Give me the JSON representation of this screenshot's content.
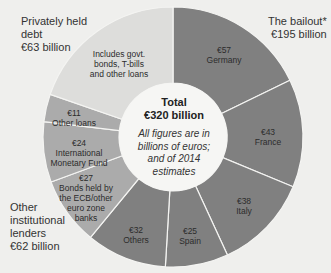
{
  "chart_data": {
    "type": "pie",
    "variant": "donut",
    "center_title": "Total",
    "center_total": "€320 billion",
    "center_note": "All figures are in billions of euros; and of 2014 estimates",
    "unit": "billion euros",
    "groups": [
      {
        "name": "The bailout*",
        "label": "The bailout*",
        "total_label": "€195 billion",
        "total": 195,
        "color": "#808080"
      },
      {
        "name": "Other institutional lenders",
        "label": "Other institutional lenders",
        "total_label": "€62 billion",
        "total": 62,
        "color": "#ababab"
      },
      {
        "name": "Privately held debt",
        "label": "Privately held debt",
        "total_label": "€63 billion",
        "total": 63,
        "color": "#dddddb"
      }
    ],
    "slices": [
      {
        "value_label": "€57",
        "name": "Germany",
        "value": 57,
        "group": "The bailout*"
      },
      {
        "value_label": "€43",
        "name": "France",
        "value": 43,
        "group": "The bailout*"
      },
      {
        "value_label": "€38",
        "name": "Italy",
        "value": 38,
        "group": "The bailout*"
      },
      {
        "value_label": "€25",
        "name": "Spain",
        "value": 25,
        "group": "The bailout*"
      },
      {
        "value_label": "€32",
        "name": "Others",
        "value": 32,
        "group": "The bailout*"
      },
      {
        "value_label": "€27",
        "name": "Bonds held by the ECB/other euro zone banks",
        "value": 27,
        "group": "Other institutional lenders"
      },
      {
        "value_label": "€24",
        "name": "International Monetary Fund",
        "value": 24,
        "group": "Other institutional lenders"
      },
      {
        "value_label": "€11",
        "name": "Other loans",
        "value": 11,
        "group": "Other institutional lenders"
      },
      {
        "value_label": "",
        "name": "Includes govt. bonds, T-bills and other loans",
        "value": 63,
        "group": "Privately held debt"
      }
    ]
  },
  "labels": {
    "private_line1": "Privately held",
    "private_line2": "debt",
    "private_total": "€63 billion",
    "bailout_line1": "The bailout*",
    "bailout_total": "€195 billion",
    "other_line1": "Other",
    "other_line2": "institutional",
    "other_line3": "lenders",
    "other_total": "€62 billion",
    "private_note_1": "Includes govt.",
    "private_note_2": "bonds, T-bills",
    "private_note_3": "and other loans",
    "germany_value": "€57",
    "germany_name": "Germany",
    "france_value": "€43",
    "france_name": "France",
    "italy_value": "€38",
    "italy_name": "Italy",
    "spain_value": "€25",
    "spain_name": "Spain",
    "others_value": "€32",
    "others_name": "Others",
    "bonds_value": "€27",
    "bonds_1": "Bonds held by",
    "bonds_2": "the ECB/other",
    "bonds_3": "euro zone",
    "bonds_4": "banks",
    "imf_value": "€24",
    "imf_1": "International",
    "imf_2": "Monetary Fund",
    "loans_value": "€11",
    "loans_name": "Other loans"
  },
  "center": {
    "title": "Total",
    "total": "€320 billion",
    "note_1": "All figures are in",
    "note_2": "billions of euros;",
    "note_3": "and of 2014",
    "note_4": "estimates"
  }
}
